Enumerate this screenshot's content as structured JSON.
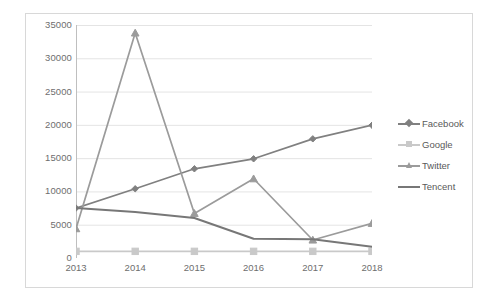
{
  "chart_data": {
    "type": "line",
    "title": "",
    "subtitle": "",
    "xlabel": "",
    "ylabel": "",
    "categories": [
      "2013",
      "2014",
      "2015",
      "2016",
      "2017",
      "2018"
    ],
    "x_tick_labels": [
      "2013",
      "2014",
      "2015",
      "2016",
      "2017",
      "2018"
    ],
    "y_tick_labels": [
      "0",
      "5000",
      "10000",
      "15000",
      "20000",
      "25000",
      "30000",
      "35000"
    ],
    "y_ticks": [
      0,
      5000,
      10000,
      15000,
      20000,
      25000,
      30000,
      35000
    ],
    "ylim": [
      0,
      35000
    ],
    "grid": "horizontal",
    "legend_position": "right",
    "series": [
      {
        "name": "Facebook",
        "color": "#808080",
        "marker": "diamond",
        "values": [
          7500,
          10400,
          13400,
          14900,
          17900,
          19950
        ]
      },
      {
        "name": "Google",
        "color": "#c9c9c9",
        "marker": "square",
        "values": [
          1000,
          1000,
          1000,
          1000,
          1000,
          1000
        ]
      },
      {
        "name": "Twitter",
        "color": "#9b9b9b",
        "marker": "triangle",
        "values": [
          4400,
          33800,
          6700,
          11900,
          2700,
          5200
        ]
      },
      {
        "name": "Tencent",
        "color": "#777777",
        "marker": "none",
        "values": [
          7500,
          6900,
          6000,
          2900,
          2800,
          1700
        ]
      }
    ]
  },
  "legend": {
    "items": [
      {
        "label": "Facebook"
      },
      {
        "label": "Google"
      },
      {
        "label": "Twitter"
      },
      {
        "label": "Tencent"
      }
    ]
  },
  "axes": {
    "y_labels": [
      "35000",
      "30000",
      "25000",
      "20000",
      "15000",
      "10000",
      "5000",
      "0"
    ],
    "x_labels": [
      "2013",
      "2014",
      "2015",
      "2016",
      "2017",
      "2018"
    ]
  },
  "colors": {
    "facebook": "#808080",
    "google": "#c9c9c9",
    "twitter": "#9b9b9b",
    "tencent": "#777777",
    "gridline": "#e4e4e4",
    "axis": "#bfbfbf",
    "text": "#6e6e6e",
    "frame": "#d8d8d8"
  }
}
